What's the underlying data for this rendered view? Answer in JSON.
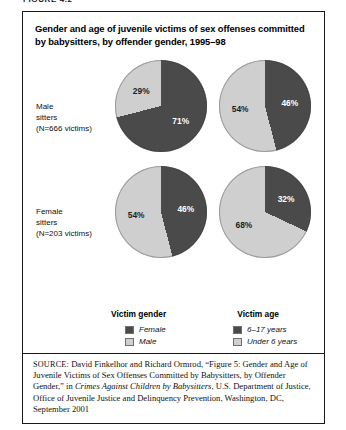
{
  "figure": {
    "label": "FIGURE 4.2"
  },
  "title": "Gender and age of juvenile victims of sex offenses committed by babysitters, by offender gender, 1995–98",
  "colors": {
    "dark": "#4a4a4a",
    "light": "#cfcfcf",
    "border": "#1a1a1a",
    "label_on_dark": "#ffffff",
    "label_on_light": "#1d1d1d"
  },
  "rows": [
    {
      "name": "male-sitters",
      "line1": "Male",
      "line2": "sitters",
      "line3": "(N=666 victims)"
    },
    {
      "name": "female-sitters",
      "line1": "Female",
      "line2": "sitters",
      "line3": "(N=203 victims)"
    }
  ],
  "pies": [
    {
      "name": "male-gender",
      "row": "Male sitters",
      "column": "Victim gender",
      "dark_label": "71%",
      "light_label": "29%",
      "dark_value": 71,
      "light_value": 29
    },
    {
      "name": "male-age",
      "row": "Male sitters",
      "column": "Victim age",
      "dark_label": "46%",
      "light_label": "54%",
      "dark_value": 46,
      "light_value": 54
    },
    {
      "name": "female-gender",
      "row": "Female sitters",
      "column": "Victim gender",
      "dark_label": "46%",
      "light_label": "54%",
      "dark_value": 46,
      "light_value": 54
    },
    {
      "name": "female-age",
      "row": "Female sitters",
      "column": "Victim age",
      "dark_label": "32%",
      "light_label": "68%",
      "dark_value": 32,
      "light_value": 68
    }
  ],
  "legends": [
    {
      "name": "victim-gender",
      "title": "Victim gender",
      "items": [
        {
          "label": "Female",
          "color": "#4a4a4a"
        },
        {
          "label": "Male",
          "color": "#cfcfcf"
        }
      ]
    },
    {
      "name": "victim-age",
      "title": "Victim age",
      "items": [
        {
          "label": "6–17 years",
          "color": "#4a4a4a"
        },
        {
          "label": "Under 6 years",
          "color": "#cfcfcf"
        }
      ]
    }
  ],
  "source": {
    "prefix": "SOURCE:",
    "text_before_italic": " David Finkelhor and Richard Ormrod, “Figure 5: Gender and Age of Juvenile Victims of Sex Offenses Committed by Babysitters, by Offender Gender,” in ",
    "italic_title": "Crimes Against Children by Babysitters",
    "text_after_italic": ", U.S. Department of Justice, Office of Juvenile Justice and Delinquency Prevention, Washington, DC, September 2001"
  },
  "chart_data": {
    "type": "pie",
    "title": "Gender and age of juvenile victims of sex offenses committed by babysitters, by offender gender, 1995–98",
    "charts": [
      {
        "row": "Male sitters (N=666 victims)",
        "column": "Victim gender",
        "categories": [
          "Female",
          "Male"
        ],
        "values": [
          71,
          29
        ],
        "labels": [
          "71%",
          "29%"
        ]
      },
      {
        "row": "Male sitters (N=666 victims)",
        "column": "Victim age",
        "categories": [
          "6–17 years",
          "Under 6 years"
        ],
        "values": [
          46,
          54
        ],
        "labels": [
          "46%",
          "54%"
        ]
      },
      {
        "row": "Female sitters (N=203 victims)",
        "column": "Victim gender",
        "categories": [
          "Female",
          "Male"
        ],
        "values": [
          46,
          54
        ],
        "labels": [
          "46%",
          "54%"
        ]
      },
      {
        "row": "Female sitters (N=203 victims)",
        "column": "Victim age",
        "categories": [
          "6–17 years",
          "Under 6 years"
        ],
        "values": [
          32,
          68
        ],
        "labels": [
          "32%",
          "68%"
        ]
      }
    ],
    "legend_position": "bottom",
    "grid": false
  }
}
